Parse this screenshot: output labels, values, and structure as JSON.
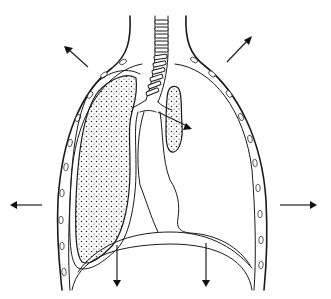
{
  "diagram": {
    "background": "#ffffff",
    "ink_color": "#1a1a1a",
    "structures": [
      {
        "name": "chest-wall",
        "description": "outer thoracic wall with embedded rib cross-sections"
      },
      {
        "name": "trachea",
        "description": "ringed airway descending from neck"
      },
      {
        "name": "right-lung",
        "description": "expanded stippled lung on viewer's left"
      },
      {
        "name": "left-lung-collapsed",
        "description": "small collapsed stippled lung near hilum on viewer's right"
      },
      {
        "name": "pleural-space",
        "description": "enlarged empty space on viewer's right"
      },
      {
        "name": "mediastinum",
        "description": "central heart/mediastinal outline"
      },
      {
        "name": "diaphragm",
        "description": "domed lower boundary"
      }
    ],
    "arrows": [
      {
        "name": "arrow-upper-left",
        "direction": "up-left"
      },
      {
        "name": "arrow-upper-right",
        "direction": "up-right"
      },
      {
        "name": "arrow-left",
        "direction": "left"
      },
      {
        "name": "arrow-right",
        "direction": "right"
      },
      {
        "name": "arrow-down-left",
        "direction": "down"
      },
      {
        "name": "arrow-down-right",
        "direction": "down"
      },
      {
        "name": "arrow-bronchus",
        "direction": "down-right"
      }
    ],
    "labels": []
  }
}
